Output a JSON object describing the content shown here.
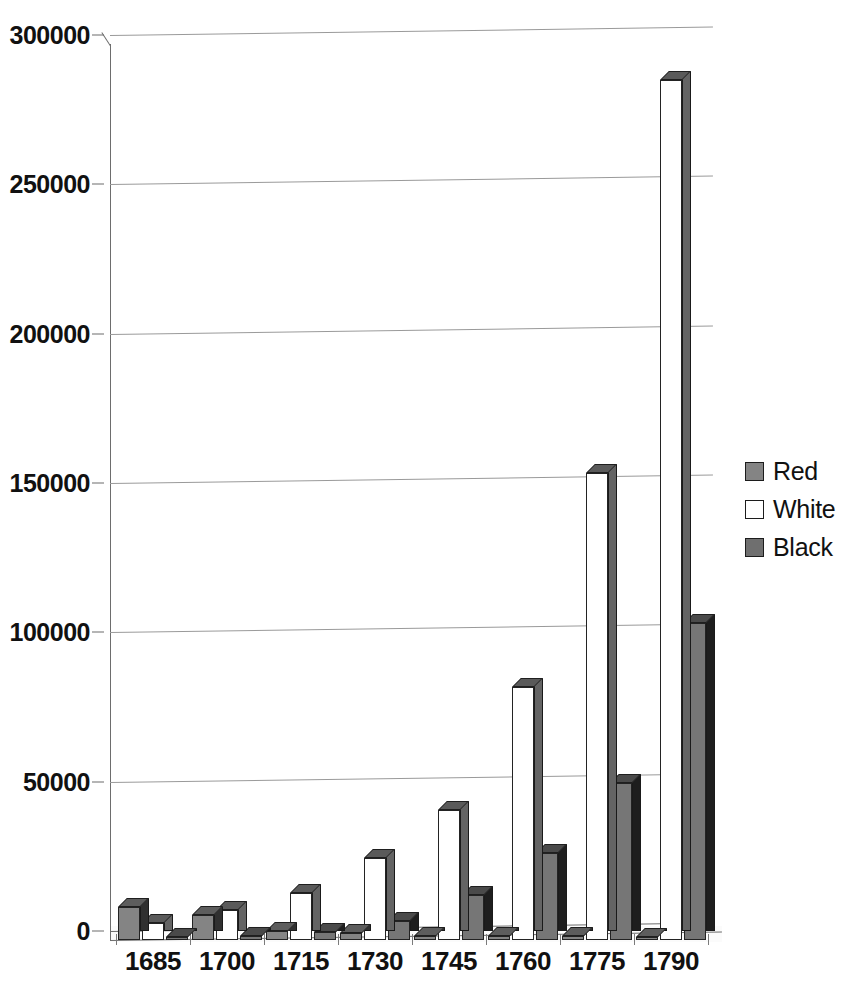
{
  "chart_data": {
    "type": "bar",
    "title": "",
    "subtitle": "",
    "xlabel": "",
    "ylabel": "",
    "categories": [
      "1685",
      "1700",
      "1715",
      "1730",
      "1745",
      "1760",
      "1775",
      "1790"
    ],
    "series": [
      {
        "name": "Red",
        "color": "#848484",
        "values": [
          11000,
          8400,
          3000,
          2200,
          1500,
          1300,
          1200,
          1000
        ]
      },
      {
        "name": "White",
        "color": "#ffffff",
        "values": [
          5700,
          10000,
          15700,
          27500,
          43500,
          84700,
          156500,
          288000
        ]
      },
      {
        "name": "Black",
        "color": "#6f6f6f",
        "values": [
          800,
          1300,
          2800,
          6500,
          15000,
          29000,
          52500,
          106000
        ]
      }
    ],
    "ylim": [
      0,
      300000
    ],
    "yticks": [
      0,
      50000,
      100000,
      150000,
      200000,
      250000,
      300000
    ],
    "ytick_labels": [
      "0",
      "50000",
      "100000",
      "150000",
      "200000",
      "250000",
      "300000"
    ],
    "grid": true,
    "grid_axis": "y",
    "legend_position": "right",
    "style": "3d-column",
    "annotations": []
  },
  "legend": {
    "items": [
      {
        "label": "Red",
        "swatch": "swatch-red"
      },
      {
        "label": "White",
        "swatch": "swatch-white"
      },
      {
        "label": "Black",
        "swatch": "swatch-black"
      }
    ]
  }
}
